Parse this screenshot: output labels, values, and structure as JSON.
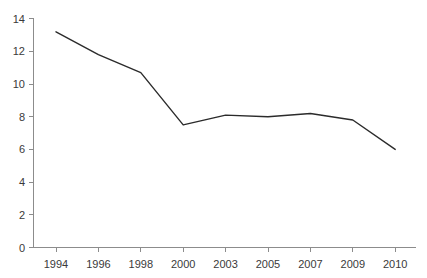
{
  "chart_data": {
    "type": "line",
    "title": "",
    "subtitle": "",
    "xlabel": "",
    "ylabel": "",
    "categories": [
      "1994",
      "1996",
      "1998",
      "2000",
      "2003",
      "2005",
      "2007",
      "2009",
      "2010"
    ],
    "values": [
      13.2,
      11.8,
      10.7,
      7.5,
      8.1,
      8.0,
      8.2,
      7.8,
      6.0
    ],
    "series": [
      {
        "name": "",
        "values": [
          13.2,
          11.8,
          10.7,
          7.5,
          8.1,
          8.0,
          8.2,
          7.8,
          6.0
        ]
      }
    ],
    "ylim": [
      0,
      14
    ],
    "yticks": [
      0,
      2,
      4,
      6,
      8,
      10,
      12,
      14
    ],
    "ytick_labels": [
      "0",
      "2",
      "4",
      "6",
      "8",
      "10",
      "12",
      "14"
    ],
    "xtick_labels": [
      "1994",
      "1996",
      "1998",
      "2000",
      "2003",
      "2005",
      "2007",
      "2009",
      "2010"
    ],
    "grid": false,
    "legend": false,
    "legend_position": "none",
    "annotations": [],
    "colors": {
      "line": "#2b2b2b",
      "axis": "#8c8c8c",
      "text": "#3a3a3a",
      "background": "#ffffff"
    }
  }
}
